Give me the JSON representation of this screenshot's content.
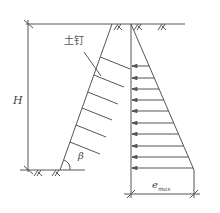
{
  "diagram": {
    "labels": {
      "soil_nail": "土钉",
      "height": "H",
      "slope_angle": "β",
      "max_pressure_base": "e",
      "max_pressure_sub": "max"
    },
    "colors": {
      "line": "#555555",
      "text": "#444444",
      "background": "#ffffff"
    },
    "geometry": {
      "ground_top_y": 24,
      "base_y": 170,
      "slope_top": [
        112,
        24
      ],
      "slope_bottom": [
        60,
        170
      ],
      "pressure_axis_x": 131,
      "pressure_triangle_tip": [
        194,
        170
      ],
      "arrow_rows_y": [
        66,
        78,
        89,
        100,
        111,
        123,
        134,
        146,
        157,
        168
      ],
      "soil_nail_rows_y": [
        57,
        75,
        92,
        108,
        125,
        142
      ]
    }
  }
}
